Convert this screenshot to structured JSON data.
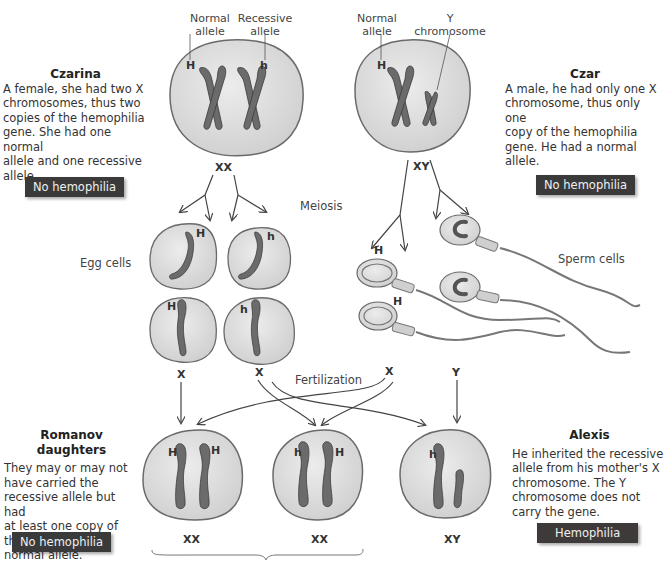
{
  "diagram": {
    "topic": "Hemophilia inheritance in the Romanov family",
    "colors": {
      "cell_fill": "#e0e0e0",
      "cell_stroke": "#6a6a6a",
      "chromosome": "#6b6b6b",
      "badge_bg": "#3a3a3a",
      "badge_text": "#f0f0f0",
      "arrow": "#444444"
    },
    "czarina": {
      "title": "Czarina",
      "description_lines": [
        "A female, she had two X",
        "chromosomes, thus two",
        "copies of the hemophilia",
        "gene. She had one normal",
        "allele and one recessive",
        "allele."
      ],
      "badge": "No hemophilia",
      "genotype": "XX",
      "labels": {
        "normal": "Normal allele",
        "recessive": "Recessive allele"
      },
      "alleles": [
        "H",
        "h"
      ]
    },
    "czar": {
      "title": "Czar",
      "description_lines": [
        "A male, he had only one X",
        "chromosome, thus only one",
        "copy of the hemophilia",
        "gene. He had a normal",
        "allele."
      ],
      "badge": "No hemophilia",
      "genotype": "XY",
      "labels": {
        "normal": "Normal allele",
        "y_chromosome": "Y chromosome"
      },
      "alleles": [
        "H"
      ]
    },
    "process": {
      "meiosis": "Meiosis",
      "fertilization": "Fertilization",
      "egg_cells": "Egg cells",
      "sperm_cells": "Sperm cells"
    },
    "eggs": [
      {
        "allele": "H"
      },
      {
        "allele": "h"
      },
      {
        "allele": "H"
      },
      {
        "allele": "h"
      }
    ],
    "sperm": [
      {
        "allele": ""
      },
      {
        "allele": "H"
      },
      {
        "allele": ""
      },
      {
        "allele": "H"
      }
    ],
    "gametes_row": {
      "x1": "X",
      "x2": "X",
      "x3": "X",
      "y": "Y"
    },
    "daughters": {
      "title": "Romanov daughters",
      "description_lines": [
        "They may or may not",
        "have carried the",
        "recessive allele but had",
        "at least one copy of the",
        "normal allele."
      ],
      "badge": "No hemophilia",
      "children": [
        {
          "genotype": "XX",
          "alleles": [
            "H",
            "H"
          ]
        },
        {
          "genotype": "XX",
          "alleles": [
            "h",
            "H"
          ]
        }
      ]
    },
    "alexis": {
      "title": "Alexis",
      "description_lines": [
        "He inherited the recessive",
        "allele from his mother's X",
        "chromosome. The Y",
        "chromosome does not",
        "carry the gene."
      ],
      "badge": "Hemophilia",
      "genotype": "XY",
      "alleles": [
        "h"
      ]
    }
  }
}
